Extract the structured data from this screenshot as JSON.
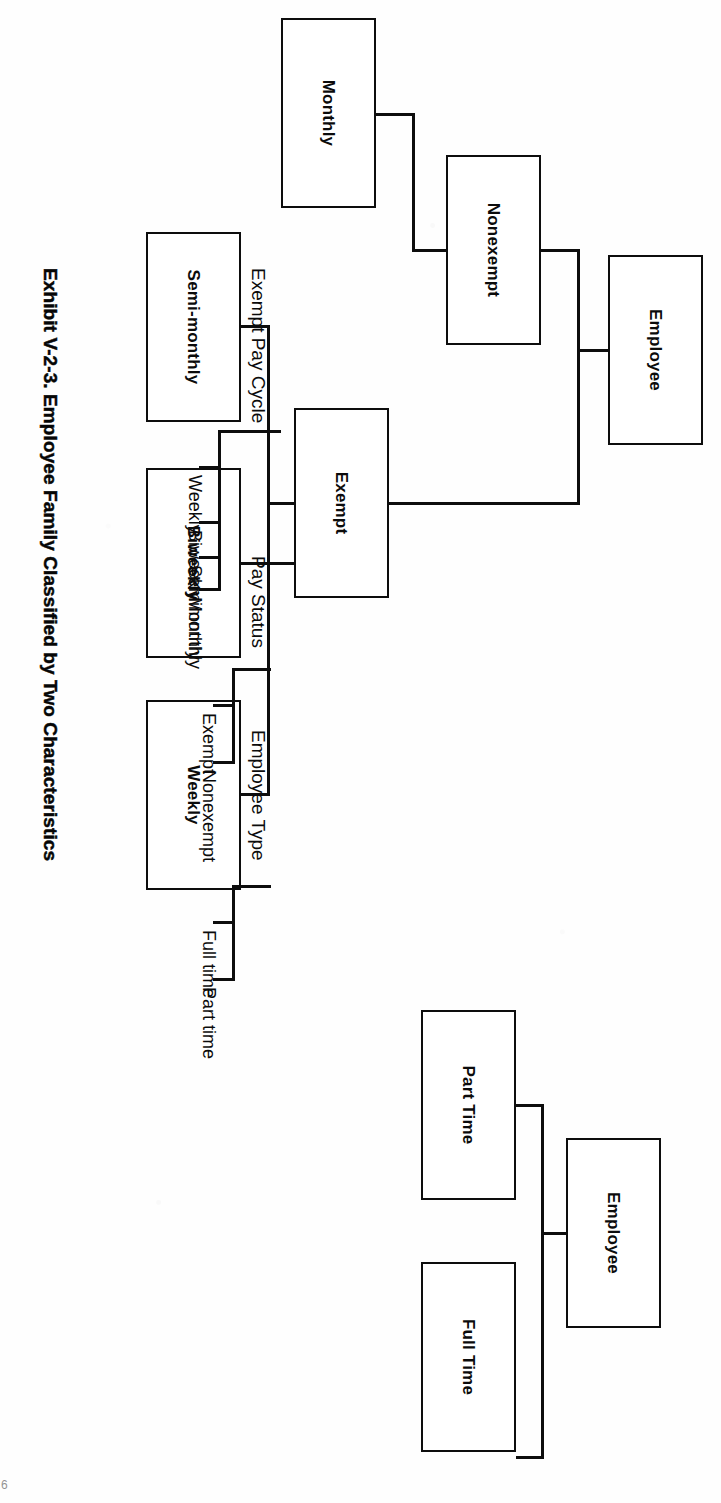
{
  "caption": "Exhibit V-2-3. Employee Family Classified by Two Characteristics",
  "page_number": "6",
  "trees": [
    {
      "name": "pay-status-tree",
      "root": {
        "label": "Employee"
      },
      "children": [
        {
          "label": "Exempt",
          "children": [
            {
              "label": "Weekly"
            },
            {
              "label": "Biweekly"
            },
            {
              "label": "Semi-monthly"
            }
          ]
        },
        {
          "label": "Nonexempt",
          "children": [
            {
              "label": "Monthly"
            }
          ]
        }
      ]
    },
    {
      "name": "employee-type-tree",
      "root": {
        "label": "Employee"
      },
      "children": [
        {
          "label": "Full Time"
        },
        {
          "label": "Part Time"
        }
      ]
    }
  ],
  "legends": [
    {
      "title": "Employee Type",
      "items": [
        "Full time",
        "Part time"
      ]
    },
    {
      "title": "Pay Status",
      "items": [
        "Exempt",
        "Nonexempt"
      ]
    },
    {
      "title": "Exempt Pay Cycle",
      "items": [
        "Weekly",
        "Biweekly",
        "Semimonthly",
        "Monthly"
      ]
    }
  ],
  "colors": {
    "ink": "#0d0d0d",
    "paper": "#ffffff"
  }
}
